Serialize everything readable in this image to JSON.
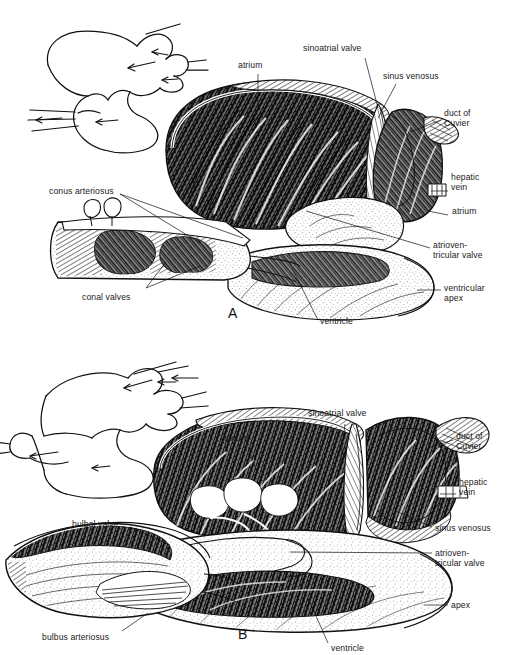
{
  "figure": {
    "background_color": "#ffffff",
    "ink_color": "#111111",
    "width": 522,
    "height": 655
  },
  "panels": [
    {
      "id": "A",
      "letter": "A",
      "letter_pos": {
        "x": 228,
        "y": 306
      },
      "inset": {
        "name": "schematic-blood-flow-inset",
        "description": "outline schematic of heart with blood-flow arrows"
      },
      "labels": [
        {
          "key": "atrium",
          "text": "atrium",
          "x": 238,
          "y": 60,
          "align": "left",
          "leader": [
            [
              258,
              74
            ],
            [
              258,
              108
            ]
          ]
        },
        {
          "key": "sinoatrial_valve",
          "text": "sinoatrial valve",
          "x": 303,
          "y": 43,
          "align": "left",
          "leader": [
            [
              365,
              58
            ],
            [
              377,
              106
            ]
          ]
        },
        {
          "key": "sinus_venosus",
          "text": "sinus venosus",
          "x": 383,
          "y": 71,
          "align": "left",
          "leader": [
            [
              395,
              84
            ],
            [
              377,
              116
            ]
          ]
        },
        {
          "key": "duct_of_cuvier",
          "text": "duct of\nCuvier",
          "x": 444,
          "y": 109,
          "align": "left",
          "leader": [
            [
              442,
              121
            ],
            [
              410,
              131
            ]
          ]
        },
        {
          "key": "hepatic_vein",
          "text": "hepatic\nvein",
          "x": 450,
          "y": 172,
          "align": "left",
          "leader": [
            [
              448,
              191
            ],
            [
              432,
              191
            ]
          ]
        },
        {
          "key": "atrium_right",
          "text": "atrium",
          "x": 450,
          "y": 211,
          "align": "left",
          "leader": [
            [
              448,
              216
            ],
            [
              430,
              212
            ]
          ]
        },
        {
          "key": "atrioventricular_valve",
          "text": "atrioven-\ntricular valve",
          "x": 432,
          "y": 240,
          "align": "left",
          "leader": [
            [
              430,
              248
            ],
            [
              305,
              210
            ]
          ]
        },
        {
          "key": "ventricular_apex",
          "text": "ventricular\napex",
          "x": 443,
          "y": 283,
          "align": "left",
          "leader": [
            [
              441,
              290
            ],
            [
              418,
              290
            ]
          ]
        },
        {
          "key": "conus_arteriosus",
          "text": "conus arteriosus",
          "x": 49,
          "y": 186,
          "align": "left",
          "leader": [
            [
              120,
              195
            ],
            [
              196,
              243
            ]
          ]
        },
        {
          "key": "conal_valves",
          "text": "conal valves",
          "x": 80,
          "y": 292,
          "align": "left",
          "leader": [
            [
              143,
              289
            ],
            [
              163,
              262
            ]
          ]
        },
        {
          "key": "ventricle",
          "text": "ventricle",
          "x": 320,
          "y": 322,
          "align": "left",
          "leader": [
            [
              320,
              322
            ],
            [
              290,
              270
            ]
          ]
        }
      ]
    },
    {
      "id": "B",
      "letter": "B",
      "letter_pos": {
        "x": 238,
        "y": 629
      },
      "inset": {
        "name": "schematic-blood-flow-inset",
        "description": "outline schematic of heart with blood-flow arrows"
      },
      "labels": [
        {
          "key": "sinoatrial_valve",
          "text": "sinoatrial valve",
          "x": 310,
          "y": 410,
          "align": "left",
          "leader": [
            [
              345,
              424
            ],
            [
              340,
              464
            ]
          ]
        },
        {
          "key": "atrium",
          "text": "atrium",
          "x": 224,
          "y": 434,
          "align": "left",
          "leader": [
            [
              248,
              447
            ],
            [
              256,
              472
            ]
          ]
        },
        {
          "key": "duct_of_cuvier",
          "text": "duct of\nCuvier",
          "x": 455,
          "y": 432,
          "align": "left",
          "leader": [
            [
              453,
              440
            ],
            [
              428,
              448
            ]
          ]
        },
        {
          "key": "hepatic_vein",
          "text": "hepatic\nvein",
          "x": 458,
          "y": 478,
          "align": "left",
          "leader": [
            [
              456,
              494
            ],
            [
              440,
              494
            ]
          ]
        },
        {
          "key": "sinus_venosus",
          "text": "sinus venosus",
          "x": 434,
          "y": 523,
          "align": "left",
          "leader": [
            [
              432,
              527
            ],
            [
              400,
              512
            ]
          ]
        },
        {
          "key": "atrioventricular_valve",
          "text": "atrioven-\ntricular valve",
          "x": 434,
          "y": 548,
          "align": "left",
          "leader": [
            [
              432,
              553
            ],
            [
              290,
              552
            ]
          ]
        },
        {
          "key": "apex",
          "text": "apex",
          "x": 450,
          "y": 601,
          "align": "left",
          "leader": [
            [
              448,
              605
            ],
            [
              424,
              605
            ]
          ]
        },
        {
          "key": "bulbal_valve",
          "text": "bulbal valve",
          "x": 73,
          "y": 519,
          "align": "left",
          "leader": [
            [
              130,
              527
            ],
            [
              168,
              545
            ]
          ]
        },
        {
          "key": "bulbus_arteriosus",
          "text": "bulbus arteriosus",
          "x": 42,
          "y": 634,
          "align": "left",
          "leader": [
            [
              122,
              631
            ],
            [
              148,
              613
            ]
          ]
        },
        {
          "key": "ventricle",
          "text": "ventricle",
          "x": 330,
          "y": 646,
          "align": "left",
          "leader": [
            [
              328,
              643
            ],
            [
              308,
              598
            ]
          ]
        }
      ]
    }
  ]
}
